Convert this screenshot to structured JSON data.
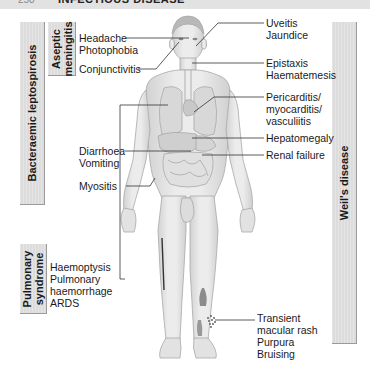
{
  "header": {
    "page_number": "258",
    "title": "INFECTIOUS DISEASE"
  },
  "side_boxes": {
    "bacteraemic": "Bacteraemic leptospirosis",
    "aseptic_line1": "Aseptic",
    "aseptic_line2": "meningitis",
    "pulmonary_line1": "Pulmonary",
    "pulmonary_line2": "syndrome",
    "weils": "Weil's disease"
  },
  "left_labels": {
    "headache": "Headache",
    "photophobia": "Photophobia",
    "conjunctivitis": "Conjunctivitis",
    "diarrhoea": "Diarrhoea",
    "vomiting": "Vomiting",
    "myositis": "Myositis",
    "haemoptysis": "Haemoptysis",
    "pulmonary": "Pulmonary",
    "haemorrhage": "haemorrhage",
    "ards": "ARDS"
  },
  "right_labels": {
    "uveitis": "Uveitis",
    "jaundice": "Jaundice",
    "epistaxis": "Epistaxis",
    "haematemesis": "Haematemesis",
    "pericarditis": "Pericarditis/",
    "myocarditis": "myocarditis/",
    "vasculitis": "vasculiitis",
    "hepatomegaly": "Hepatomegaly",
    "renal_failure": "Renal failure",
    "transient": "Transient",
    "macular_rash": "macular rash",
    "purpura": "Purpura",
    "bruising": "Bruising"
  },
  "colors": {
    "box_fill": "#dcdcdc",
    "box_edge": "#9a9a9a",
    "body_fill": "#e6e6e6",
    "body_edge": "#a8a8a8",
    "leader": "#333333"
  }
}
